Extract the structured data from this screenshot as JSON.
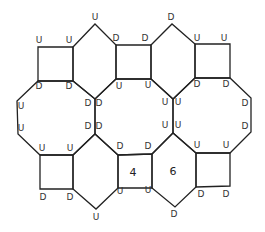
{
  "diagram": {
    "cells": [
      {
        "id": "square-top-left",
        "shape": "square",
        "number": ""
      },
      {
        "id": "hex-top-1",
        "shape": "hexagon",
        "number": ""
      },
      {
        "id": "square-top-middle",
        "shape": "square",
        "number": ""
      },
      {
        "id": "hex-top-2",
        "shape": "hexagon",
        "number": ""
      },
      {
        "id": "square-top-right",
        "shape": "square",
        "number": ""
      },
      {
        "id": "octagon-left",
        "shape": "octagon",
        "number": ""
      },
      {
        "id": "octagon-middle",
        "shape": "octagon",
        "number": ""
      },
      {
        "id": "octagon-right",
        "shape": "octagon",
        "number": ""
      },
      {
        "id": "square-bottom-left",
        "shape": "square",
        "number": ""
      },
      {
        "id": "hex-bottom-1",
        "shape": "hexagon",
        "number": ""
      },
      {
        "id": "square-bottom-middle",
        "shape": "square",
        "number": "4"
      },
      {
        "id": "hex-bottom-2",
        "shape": "hexagon",
        "number": "6"
      },
      {
        "id": "square-bottom-right",
        "shape": "square",
        "number": ""
      }
    ],
    "labels": [
      {
        "t": "U",
        "x": 95,
        "y": 20
      },
      {
        "t": "D",
        "x": 171,
        "y": 20
      },
      {
        "t": "U",
        "x": 39,
        "y": 43
      },
      {
        "t": "U",
        "x": 69,
        "y": 43
      },
      {
        "t": "D",
        "x": 116,
        "y": 41
      },
      {
        "t": "D",
        "x": 145,
        "y": 41
      },
      {
        "t": "U",
        "x": 197,
        "y": 41
      },
      {
        "t": "U",
        "x": 224,
        "y": 41
      },
      {
        "t": "D",
        "x": 39,
        "y": 89
      },
      {
        "t": "D",
        "x": 69,
        "y": 89
      },
      {
        "t": "U",
        "x": 119,
        "y": 89
      },
      {
        "t": "U",
        "x": 148,
        "y": 88
      },
      {
        "t": "D",
        "x": 197,
        "y": 87
      },
      {
        "t": "D",
        "x": 226,
        "y": 87
      },
      {
        "t": "U",
        "x": 21,
        "y": 109
      },
      {
        "t": "D",
        "x": 88,
        "y": 106
      },
      {
        "t": "D",
        "x": 99,
        "y": 106
      },
      {
        "t": "U",
        "x": 165,
        "y": 105
      },
      {
        "t": "U",
        "x": 178,
        "y": 105
      },
      {
        "t": "D",
        "x": 245,
        "y": 106
      },
      {
        "t": "U",
        "x": 21,
        "y": 131
      },
      {
        "t": "D",
        "x": 88,
        "y": 129
      },
      {
        "t": "D",
        "x": 99,
        "y": 129
      },
      {
        "t": "U",
        "x": 165,
        "y": 128
      },
      {
        "t": "U",
        "x": 178,
        "y": 128
      },
      {
        "t": "D",
        "x": 245,
        "y": 129
      },
      {
        "t": "U",
        "x": 42,
        "y": 151
      },
      {
        "t": "U",
        "x": 70,
        "y": 151
      },
      {
        "t": "D",
        "x": 120,
        "y": 149
      },
      {
        "t": "D",
        "x": 148,
        "y": 149
      },
      {
        "t": "U",
        "x": 197,
        "y": 148
      },
      {
        "t": "U",
        "x": 226,
        "y": 148
      },
      {
        "t": "D",
        "x": 43,
        "y": 200
      },
      {
        "t": "D",
        "x": 70,
        "y": 200
      },
      {
        "t": "U",
        "x": 120,
        "y": 194
      },
      {
        "t": "U",
        "x": 148,
        "y": 193
      },
      {
        "t": "D",
        "x": 201,
        "y": 197
      },
      {
        "t": "D",
        "x": 226,
        "y": 197
      },
      {
        "t": "U",
        "x": 96,
        "y": 220
      },
      {
        "t": "D",
        "x": 174,
        "y": 217
      }
    ],
    "numbers": [
      {
        "t": "4",
        "x": 133,
        "y": 176
      },
      {
        "t": "6",
        "x": 173,
        "y": 175
      }
    ]
  }
}
